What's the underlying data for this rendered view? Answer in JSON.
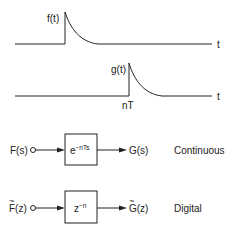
{
  "signals": {
    "f": {
      "label": "f(t)",
      "axis_label": "t"
    },
    "g": {
      "label": "g(t)",
      "axis_label": "t",
      "delay_label": "nT"
    }
  },
  "continuous": {
    "input": "F(s)",
    "transfer_base": "e",
    "transfer_exp": "−nTs",
    "output": "G(s)",
    "domain_label": "Continuous"
  },
  "digital": {
    "input_tilde": "~",
    "input": "F(z)",
    "transfer_base": "z",
    "transfer_exp": "−n",
    "output_tilde": "~",
    "output": "G(z)",
    "domain_label": "Digital"
  },
  "colors": {
    "ink": "#222222",
    "background": "#ffffff"
  }
}
